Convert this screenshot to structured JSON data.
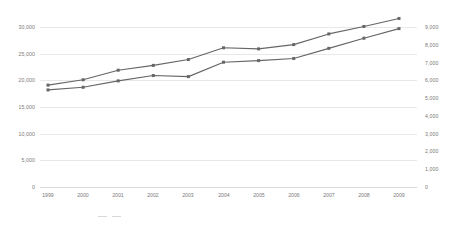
{
  "chart_data": {
    "type": "line",
    "title": "",
    "subtitle": "",
    "xlabel": "",
    "ylabel": "",
    "grid": true,
    "legend_position": "bottom",
    "categories": [
      "1999",
      "2000",
      "2001",
      "2002",
      "2003",
      "2004",
      "2005",
      "2006",
      "2007",
      "2008",
      "2009"
    ],
    "x": [
      1999,
      2000,
      2001,
      2002,
      2003,
      2004,
      2005,
      2006,
      2007,
      2008,
      2009
    ],
    "left_axis": {
      "label": "",
      "ylim": [
        0,
        30000
      ],
      "ticks": [
        0,
        5000,
        10000,
        15000,
        20000,
        25000,
        30000
      ],
      "ticklabels": [
        "0",
        "5,000",
        "10,000",
        "15,000",
        "20,000",
        "25,000",
        "30,000"
      ]
    },
    "right_axis": {
      "label": "",
      "ylim": [
        0,
        9000
      ],
      "ticks": [
        0,
        1000,
        2000,
        3000,
        4000,
        5000,
        6000,
        7000,
        8000,
        9000
      ],
      "ticklabels": [
        "0",
        "1,000",
        "2,000",
        "3,000",
        "4,000",
        "5,000",
        "6,000",
        "7,000",
        "8,000",
        "9,000"
      ]
    },
    "series": [
      {
        "name": "series-upper",
        "axis": "left",
        "color": "#666666",
        "marker": "square",
        "values": [
          19100,
          20100,
          21900,
          22800,
          23900,
          26100,
          25900,
          26700,
          28700,
          30100,
          31600
        ]
      },
      {
        "name": "series-lower",
        "axis": "left",
        "color": "#666666",
        "marker": "square",
        "values": [
          18200,
          18700,
          19900,
          20900,
          20700,
          23400,
          23700,
          24100,
          26000,
          27900,
          29700
        ]
      }
    ],
    "colors": {
      "line": "#666666",
      "grid": "#e8e8e8",
      "axis_text": "#7a7a7a",
      "background": "#ffffff"
    }
  },
  "caption": {
    "legend_a": "",
    "legend_b": "",
    "text": ""
  }
}
